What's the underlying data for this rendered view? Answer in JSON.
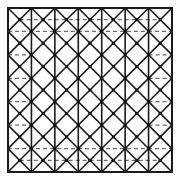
{
  "diagram": {
    "type": "lattice-pattern",
    "frame": {
      "x": 8,
      "y": 8,
      "size": 164
    },
    "columns": 7,
    "half_step_count": 14,
    "colors": {
      "line": "#1a1a1a",
      "dash": "#6b6b6b",
      "node": "#111111",
      "background": "#ffffff"
    },
    "dashed_lines": [
      {
        "y_step": 1,
        "from_step": 1,
        "to_step": 13
      },
      {
        "y_step": 2,
        "from_step": 0,
        "to_step": 14
      },
      {
        "y_step": 4,
        "from_step": 0,
        "to_step": 2
      },
      {
        "y_step": 4,
        "from_step": 12,
        "to_step": 14
      },
      {
        "y_step": 6,
        "from_step": 0,
        "to_step": 2
      },
      {
        "y_step": 6,
        "from_step": 12,
        "to_step": 14
      },
      {
        "y_step": 8,
        "from_step": 0,
        "to_step": 2
      },
      {
        "y_step": 8,
        "from_step": 12,
        "to_step": 14
      },
      {
        "y_step": 10,
        "from_step": 0,
        "to_step": 2
      },
      {
        "y_step": 10,
        "from_step": 12,
        "to_step": 14
      },
      {
        "y_step": 12,
        "from_step": 0,
        "to_step": 14
      },
      {
        "y_step": 13,
        "from_step": 1,
        "to_step": 13
      }
    ]
  }
}
